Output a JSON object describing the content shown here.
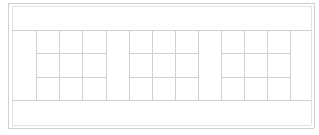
{
  "diagram": {
    "type": "empty-grid-wireframe",
    "line_color": "#cfcfcf",
    "background": "#ffffff",
    "outer_frame": {
      "left": 8,
      "top": 3,
      "right": 314,
      "bottom": 128
    },
    "inner_frame": {
      "left": 12,
      "top": 6,
      "right": 311,
      "bottom": 125
    },
    "grid_top": 30,
    "grid_bottom": 100,
    "row_dividers": [
      53,
      77
    ],
    "column_lines": [
      36,
      59,
      82,
      106,
      129,
      152,
      175,
      198,
      221,
      244,
      267,
      290
    ],
    "groups": [
      {
        "name": "group-1",
        "left": 36,
        "right": 106,
        "rows": 3,
        "cols": 3
      },
      {
        "name": "group-2",
        "left": 129,
        "right": 198,
        "rows": 3,
        "cols": 3
      },
      {
        "name": "group-3",
        "left": 221,
        "right": 290,
        "rows": 3,
        "cols": 3
      }
    ],
    "captions": [
      "",
      ""
    ]
  }
}
